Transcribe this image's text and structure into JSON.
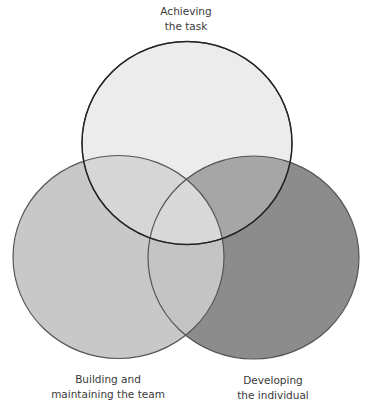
{
  "diagram": {
    "type": "venn",
    "title": "",
    "circles": [
      {
        "id": "task",
        "label_lines": [
          "Achieving",
          "the task"
        ],
        "fill": "#ececec",
        "cx": 187,
        "cy": 143,
        "rx": 105,
        "ry": 101.5
      },
      {
        "id": "team",
        "label_lines": [
          "Building and",
          "maintaining the team"
        ],
        "fill": "#c8c8c8",
        "cx": 118.5,
        "cy": 257,
        "rx": 105.5,
        "ry": 101.5
      },
      {
        "id": "individual",
        "label_lines": [
          "Developing",
          "the individual"
        ],
        "fill": "#8c8c8c",
        "cx": 253.5,
        "cy": 257.5,
        "rx": 105.5,
        "ry": 101.5
      }
    ],
    "overlap_colors": {
      "task_team": "#d6d6d6",
      "task_individual": "#a6a6a6",
      "team_individual": "#c4c4c4",
      "all": "#d9d9d9"
    },
    "stroke": "#2a2a2a"
  },
  "labels": {
    "top": {
      "line1": "Achieving",
      "line2": "the task"
    },
    "left": {
      "line1": "Building and",
      "line2": "maintaining the team"
    },
    "right": {
      "line1": "Developing",
      "line2": "the individual"
    }
  }
}
